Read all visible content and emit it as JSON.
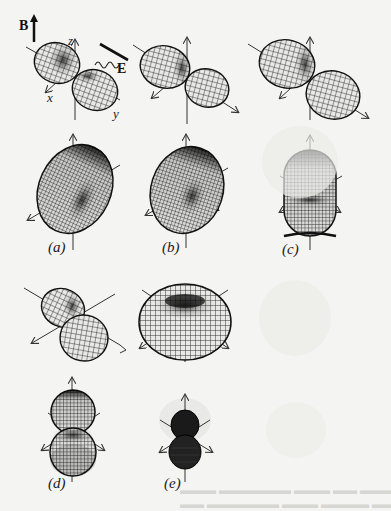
{
  "figure": {
    "background": "#f4f4f2",
    "ink_color": "#1a1a1a",
    "field_labels": {
      "magnetic": "B",
      "electric": "E"
    },
    "axis_labels": {
      "x": "x",
      "y": "y",
      "z": "z"
    },
    "panels": [
      {
        "id": "top-1",
        "shape": "two-lobe dipole, tilted",
        "label": ""
      },
      {
        "id": "top-2",
        "shape": "two-lobe dipole, tilted",
        "label": ""
      },
      {
        "id": "top-3",
        "shape": "two-lobe dipole, tilted",
        "label": ""
      },
      {
        "id": "a",
        "shape": "tilted toroid",
        "label": "(a)"
      },
      {
        "id": "b",
        "shape": "tilted toroid",
        "label": "(b)"
      },
      {
        "id": "c",
        "shape": "upright toroid / capsule",
        "label": "(c)"
      },
      {
        "id": "mid-1",
        "shape": "two-lobe dipole, tilted",
        "label": ""
      },
      {
        "id": "mid-2",
        "shape": "flattened toroid",
        "label": ""
      },
      {
        "id": "d",
        "shape": "vertical peanut",
        "label": "(d)"
      },
      {
        "id": "e",
        "shape": "small vertical peanut",
        "label": "(e)"
      }
    ]
  }
}
